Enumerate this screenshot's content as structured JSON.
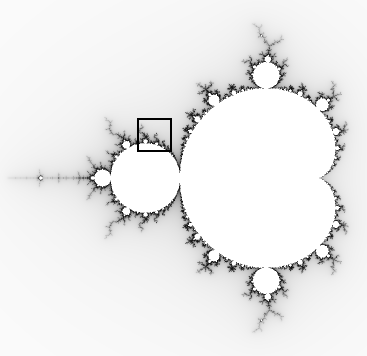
{
  "image": {
    "subject": "Mandelbrot set",
    "width": 367,
    "height": 356,
    "background_color": "#ffffff",
    "interior_color": "#ffffff",
    "boundary_color": "#1a1a1a"
  },
  "viewport": {
    "origin_px_x": 283.5,
    "origin_px_y": 178,
    "pixels_per_unit": 138,
    "max_iterations": 200
  },
  "highlight_box": {
    "left": 137,
    "top": 118,
    "width": 35,
    "height": 34,
    "border_width": 2,
    "border_color": "#000000"
  }
}
